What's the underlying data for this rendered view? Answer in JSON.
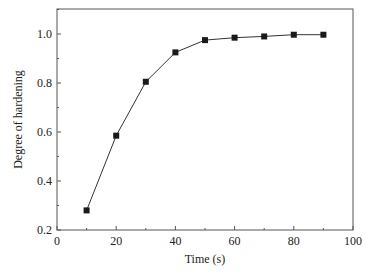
{
  "chart_data": {
    "type": "line",
    "title": "",
    "xlabel": "Time (s)",
    "ylabel": "Degree of hardening",
    "xlim": [
      0,
      100
    ],
    "ylim": [
      0.2,
      1.1
    ],
    "xticks": [
      0,
      20,
      40,
      60,
      80,
      100
    ],
    "xtick_labels": [
      "0",
      "20",
      "40",
      "60",
      "80",
      "100"
    ],
    "yticks": [
      0.2,
      0.4,
      0.6,
      0.8,
      1.0
    ],
    "ytick_labels": [
      "0.2",
      "0.4",
      "0.6",
      "0.8",
      "1.0"
    ],
    "grid": false,
    "legend": "none",
    "series": [
      {
        "name": "Degree of hardening",
        "marker": "square",
        "color": "#1a1a1a",
        "x": [
          10,
          20,
          30,
          40,
          50,
          60,
          70,
          80,
          90
        ],
        "values": [
          0.28,
          0.585,
          0.805,
          0.925,
          0.975,
          0.985,
          0.99,
          0.997,
          0.997
        ]
      }
    ]
  }
}
